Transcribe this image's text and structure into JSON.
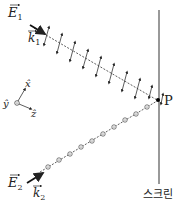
{
  "diagram": {
    "wave1": {
      "field_label": "E",
      "field_sub": "1",
      "k_label": "k",
      "k_sub": "1",
      "polarization": "in-plane (double arrows)",
      "arrow_count": 9
    },
    "wave2": {
      "field_label": "E",
      "field_sub": "2",
      "k_label": "k",
      "k_sub": "2",
      "polarization": "out-of-plane (dotted circles)",
      "circle_count": 10
    },
    "axes": {
      "x_label": "x̂",
      "y_label": "ŷ",
      "z_label": "ẑ"
    },
    "point_label": "P",
    "screen_label": "스크린"
  }
}
